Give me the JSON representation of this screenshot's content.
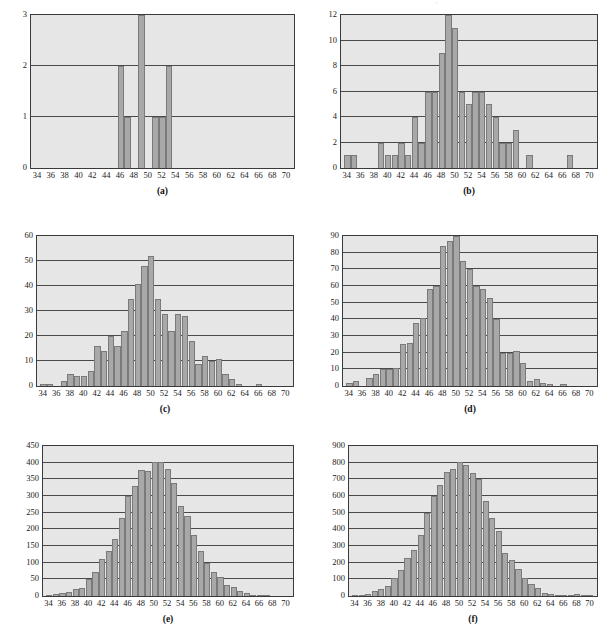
{
  "page": {
    "background_color": "#ffffff",
    "plot_background_color": "#e6e6e6",
    "bar_color": "#a8a8a8",
    "bar_border_color": "#7a7a7a",
    "axis_color": "#3a3a3a",
    "artifact_mark": "'"
  },
  "charts": [
    {
      "id": "a",
      "caption": "(a)",
      "chart_data": {
        "type": "bar",
        "title": "",
        "xlabel": "",
        "ylabel": "",
        "grid": true,
        "legend": "none",
        "xlim": [
          33,
          71
        ],
        "ylim": [
          0,
          3
        ],
        "xticks": [
          34,
          36,
          38,
          40,
          42,
          44,
          46,
          48,
          50,
          52,
          54,
          56,
          58,
          60,
          62,
          64,
          66,
          68,
          70
        ],
        "yticks": [
          0,
          1,
          2,
          3
        ],
        "x": [
          34,
          35,
          36,
          37,
          38,
          39,
          40,
          41,
          42,
          43,
          44,
          45,
          46,
          47,
          48,
          49,
          50,
          51,
          52,
          53,
          54,
          55,
          56,
          57,
          58,
          59,
          60,
          61,
          62,
          63,
          64,
          65,
          66,
          67,
          68,
          69,
          70
        ],
        "values": [
          0,
          0,
          0,
          0,
          0,
          0,
          0,
          0,
          0,
          0,
          0,
          0,
          2,
          1,
          0,
          3,
          0,
          1,
          1,
          2,
          0,
          0,
          0,
          0,
          0,
          0,
          0,
          0,
          0,
          0,
          0,
          0,
          0,
          0,
          0,
          0,
          0
        ]
      }
    },
    {
      "id": "b",
      "caption": "(b)",
      "chart_data": {
        "type": "bar",
        "title": "",
        "xlabel": "",
        "ylabel": "",
        "grid": true,
        "legend": "none",
        "xlim": [
          33,
          71
        ],
        "ylim": [
          0,
          12
        ],
        "xticks": [
          34,
          36,
          38,
          40,
          42,
          44,
          46,
          48,
          50,
          52,
          54,
          56,
          58,
          60,
          62,
          64,
          66,
          68,
          70
        ],
        "yticks": [
          0,
          2,
          4,
          6,
          8,
          10,
          12
        ],
        "x": [
          34,
          35,
          36,
          37,
          38,
          39,
          40,
          41,
          42,
          43,
          44,
          45,
          46,
          47,
          48,
          49,
          50,
          51,
          52,
          53,
          54,
          55,
          56,
          57,
          58,
          59,
          60,
          61,
          62,
          63,
          64,
          65,
          66,
          67,
          68,
          69,
          70
        ],
        "values": [
          1,
          1,
          0,
          0,
          0,
          2,
          1,
          1,
          2,
          1,
          4,
          2,
          6,
          6,
          9,
          12,
          11,
          6,
          5,
          6,
          6,
          5,
          4,
          2,
          2,
          3,
          0,
          1,
          0,
          0,
          0,
          0,
          0,
          1,
          0,
          0,
          0
        ]
      }
    },
    {
      "id": "c",
      "caption": "(c)",
      "chart_data": {
        "type": "bar",
        "title": "",
        "xlabel": "",
        "ylabel": "",
        "grid": true,
        "legend": "none",
        "xlim": [
          33,
          71
        ],
        "ylim": [
          0,
          60
        ],
        "xticks": [
          34,
          36,
          38,
          40,
          42,
          44,
          46,
          48,
          50,
          52,
          54,
          56,
          58,
          60,
          62,
          64,
          66,
          68,
          70
        ],
        "yticks": [
          0,
          10,
          20,
          30,
          40,
          50,
          60
        ],
        "x": [
          34,
          35,
          36,
          37,
          38,
          39,
          40,
          41,
          42,
          43,
          44,
          45,
          46,
          47,
          48,
          49,
          50,
          51,
          52,
          53,
          54,
          55,
          56,
          57,
          58,
          59,
          60,
          61,
          62,
          63,
          64,
          65,
          66,
          67,
          68,
          69,
          70
        ],
        "values": [
          1,
          1,
          0,
          2,
          5,
          4,
          4,
          6,
          16,
          14,
          20,
          16,
          22,
          35,
          41,
          48,
          52,
          35,
          29,
          22,
          29,
          28,
          18,
          9,
          12,
          10,
          11,
          5,
          3,
          1,
          0,
          0,
          1,
          0,
          0,
          0,
          0
        ]
      }
    },
    {
      "id": "d",
      "caption": "(d)",
      "chart_data": {
        "type": "bar",
        "title": "",
        "xlabel": "",
        "ylabel": "",
        "grid": true,
        "legend": "none",
        "xlim": [
          33,
          71
        ],
        "ylim": [
          0,
          90
        ],
        "xticks": [
          34,
          36,
          38,
          40,
          42,
          44,
          46,
          48,
          50,
          52,
          54,
          56,
          58,
          60,
          62,
          64,
          66,
          68,
          70
        ],
        "yticks": [
          0,
          10,
          20,
          30,
          40,
          50,
          60,
          70,
          80,
          90
        ],
        "x": [
          34,
          35,
          36,
          37,
          38,
          39,
          40,
          41,
          42,
          43,
          44,
          45,
          46,
          47,
          48,
          49,
          50,
          51,
          52,
          53,
          54,
          55,
          56,
          57,
          58,
          59,
          60,
          61,
          62,
          63,
          64,
          65,
          66,
          67,
          68,
          69,
          70
        ],
        "values": [
          2,
          3,
          0,
          5,
          7,
          10,
          10,
          11,
          25,
          26,
          38,
          41,
          58,
          60,
          84,
          87,
          90,
          75,
          70,
          60,
          58,
          53,
          40,
          20,
          20,
          21,
          14,
          3,
          4,
          2,
          1,
          0,
          1,
          0,
          0,
          0,
          0
        ]
      }
    },
    {
      "id": "e",
      "caption": "(e)",
      "chart_data": {
        "type": "bar",
        "title": "",
        "xlabel": "",
        "ylabel": "",
        "grid": true,
        "legend": "none",
        "xlim": [
          33,
          71
        ],
        "ylim": [
          0,
          450
        ],
        "xticks": [
          34,
          36,
          38,
          40,
          42,
          44,
          46,
          48,
          50,
          52,
          54,
          56,
          58,
          60,
          62,
          64,
          66,
          68,
          70
        ],
        "yticks": [
          0,
          50,
          100,
          150,
          200,
          250,
          300,
          350,
          400,
          450
        ],
        "x": [
          34,
          35,
          36,
          37,
          38,
          39,
          40,
          41,
          42,
          43,
          44,
          45,
          46,
          47,
          48,
          49,
          50,
          51,
          52,
          53,
          54,
          55,
          56,
          57,
          58,
          59,
          60,
          61,
          62,
          63,
          64,
          65,
          66,
          67,
          68,
          69,
          70
        ],
        "values": [
          3,
          6,
          8,
          12,
          20,
          25,
          50,
          73,
          110,
          135,
          171,
          235,
          301,
          331,
          378,
          375,
          402,
          403,
          381,
          338,
          271,
          239,
          183,
          135,
          100,
          73,
          56,
          34,
          28,
          14,
          8,
          1,
          1,
          3,
          0,
          0,
          0
        ]
      }
    },
    {
      "id": "f",
      "caption": "(f)",
      "chart_data": {
        "type": "bar",
        "title": "",
        "xlabel": "",
        "ylabel": "",
        "grid": true,
        "legend": "none",
        "xlim": [
          33,
          71
        ],
        "ylim": [
          0,
          900
        ],
        "xticks": [
          34,
          36,
          38,
          40,
          42,
          44,
          46,
          48,
          50,
          52,
          54,
          56,
          58,
          60,
          62,
          64,
          66,
          68,
          70
        ],
        "yticks": [
          0,
          100,
          200,
          300,
          400,
          500,
          600,
          700,
          800,
          900
        ],
        "x": [
          34,
          35,
          36,
          37,
          38,
          39,
          40,
          41,
          42,
          43,
          44,
          45,
          46,
          47,
          48,
          49,
          50,
          51,
          52,
          53,
          54,
          55,
          56,
          57,
          58,
          59,
          60,
          61,
          62,
          63,
          64,
          65,
          66,
          67,
          68,
          69,
          70
        ],
        "values": [
          2,
          3,
          10,
          32,
          45,
          58,
          110,
          155,
          230,
          275,
          368,
          499,
          600,
          667,
          742,
          765,
          805,
          787,
          737,
          700,
          568,
          466,
          388,
          259,
          218,
          163,
          110,
          70,
          50,
          16,
          10,
          2,
          3,
          8,
          12,
          2,
          3
        ]
      }
    }
  ]
}
